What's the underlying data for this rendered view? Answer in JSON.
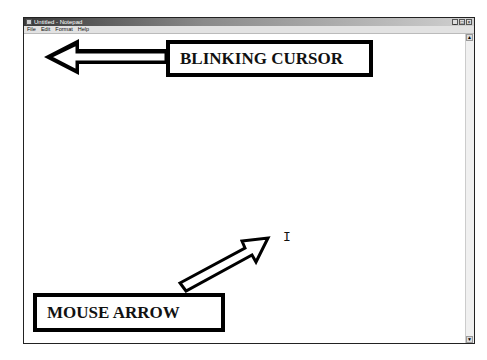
{
  "window": {
    "title": "Untitled - Notepad",
    "controls": {
      "minimize": "_",
      "maximize": "□",
      "close": "×"
    }
  },
  "menubar": {
    "items": [
      {
        "label": "File"
      },
      {
        "label": "Edit"
      },
      {
        "label": "Format"
      },
      {
        "label": "Help"
      }
    ]
  },
  "editor": {
    "content": ""
  },
  "scrollbar": {
    "up": "▲",
    "down": "▼"
  },
  "annotations": {
    "blinking_cursor_label": "BLINKING CURSOR",
    "mouse_arrow_label": "MOUSE ARROW"
  },
  "pointer": {
    "glyph": "I"
  }
}
